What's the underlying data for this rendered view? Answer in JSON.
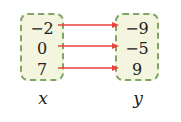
{
  "diagram": {
    "type": "mapping",
    "domain": {
      "label": "x",
      "values": [
        "−2",
        "0",
        "7"
      ]
    },
    "range": {
      "label": "y",
      "values": [
        "−9",
        "−5",
        "9"
      ]
    },
    "mappings": [
      {
        "from": "−2",
        "to": "−9"
      },
      {
        "from": "0",
        "to": "−5"
      },
      {
        "from": "7",
        "to": "9"
      }
    ],
    "colors": {
      "box_fill": "#f3f5df",
      "box_border": "#7fa463",
      "arrow": "#e8453c"
    }
  }
}
